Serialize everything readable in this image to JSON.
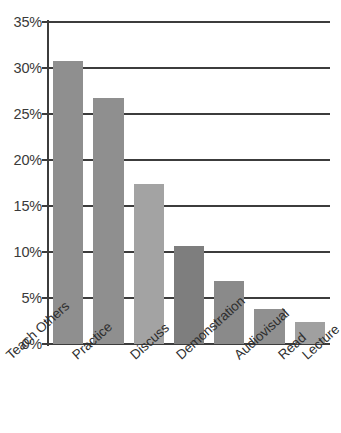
{
  "chart_data": {
    "type": "bar",
    "title": "",
    "subtitle": "",
    "xlabel": "",
    "ylabel": "",
    "categories": [
      "Teach Others",
      "Practice",
      "Discuss",
      "Demonstration",
      "Audiovisual",
      "Read",
      "Lecture"
    ],
    "values": [
      30.8,
      26.7,
      17.4,
      10.7,
      6.8,
      3.8,
      2.4
    ],
    "value_labels": [
      "",
      "",
      "",
      "",
      "",
      "",
      ""
    ],
    "bar_colors": [
      "#8f8f8f",
      "#8f8f8f",
      "#a3a3a3",
      "#7e7e7e",
      "#8a8a8a",
      "#909090",
      "#a0a0a0"
    ],
    "ylim": [
      0,
      35
    ],
    "ytick_values": [
      0,
      5,
      10,
      15,
      20,
      25,
      30,
      35
    ],
    "ytick_labels": [
      "0%",
      "5%",
      "10%",
      "15%",
      "20%",
      "25%",
      "30%",
      "35%"
    ],
    "grid": true,
    "grid_axis": "y",
    "grid_color": "#3c3c3c",
    "legend": false,
    "legend_position": "none",
    "axis_color": "#3c3c3c",
    "background_color": "#ffffff",
    "xtick_rotation": -42
  }
}
